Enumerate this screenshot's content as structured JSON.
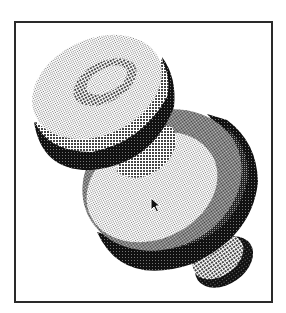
{
  "viewport": {
    "frame": {
      "x": 14,
      "y": 21,
      "width": 255,
      "height": 278,
      "border_color": "#2a2a2a"
    }
  },
  "illustration": {
    "subject": "3D shaded mechanical part (stepped shaft with collars)",
    "style": "dithered halftone",
    "colors": {
      "light": "#d8d8d8",
      "mid": "#8a8a8a",
      "dark": "#3a3a3a",
      "black": "#111111",
      "white": "#ffffff"
    }
  },
  "cursor": {
    "icon": "arrow-pointer-icon",
    "x": 150,
    "y": 197
  }
}
